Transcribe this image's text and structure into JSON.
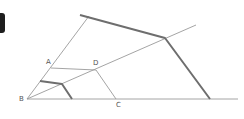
{
  "diagram": {
    "title": "",
    "points": {
      "A": {
        "label": "A",
        "x": 50,
        "y": 68,
        "label_x": 46,
        "label_y": 59
      },
      "B": {
        "label": "B",
        "x": 27,
        "y": 99,
        "label_x": 19,
        "label_y": 96
      },
      "C": {
        "label": "C",
        "x": 116,
        "y": 99,
        "label_x": 116,
        "label_y": 102
      },
      "D": {
        "label": "D",
        "x": 96,
        "y": 69,
        "label_x": 93,
        "label_y": 60
      }
    },
    "thin_lines": [
      {
        "name": "baseline-ray",
        "x1": 27,
        "y1": 99,
        "x2": 238,
        "y2": 99
      },
      {
        "name": "upper-ray",
        "x1": 27,
        "y1": 99,
        "x2": 89,
        "y2": 16
      },
      {
        "name": "middle-ray",
        "x1": 27,
        "y1": 99,
        "x2": 196,
        "y2": 25
      },
      {
        "name": "segment-AD",
        "x1": 51,
        "y1": 68,
        "x2": 96,
        "y2": 70
      },
      {
        "name": "segment-DC",
        "x1": 96,
        "y1": 70,
        "x2": 116,
        "y2": 99
      }
    ],
    "thick_polylines": [
      {
        "name": "outer-polyline",
        "points": "80,15 165,38 210,99"
      },
      {
        "name": "inner-polyline",
        "points": "40,81 62,84 72,99"
      }
    ],
    "colors": {
      "thin": "#9a9a9a",
      "thick": "#6e6e6e",
      "label": "#555555",
      "edge_bar": "#1e1e1e"
    }
  }
}
